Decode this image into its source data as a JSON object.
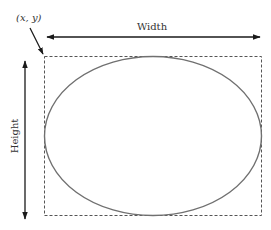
{
  "diagram": {
    "origin_label": "(x, y)",
    "width_label": "Width",
    "height_label": "Height",
    "colors": {
      "arrow": "#1a1a1a",
      "box_dashed": "#555555",
      "ellipse": "#707070",
      "text": "#333333"
    }
  }
}
